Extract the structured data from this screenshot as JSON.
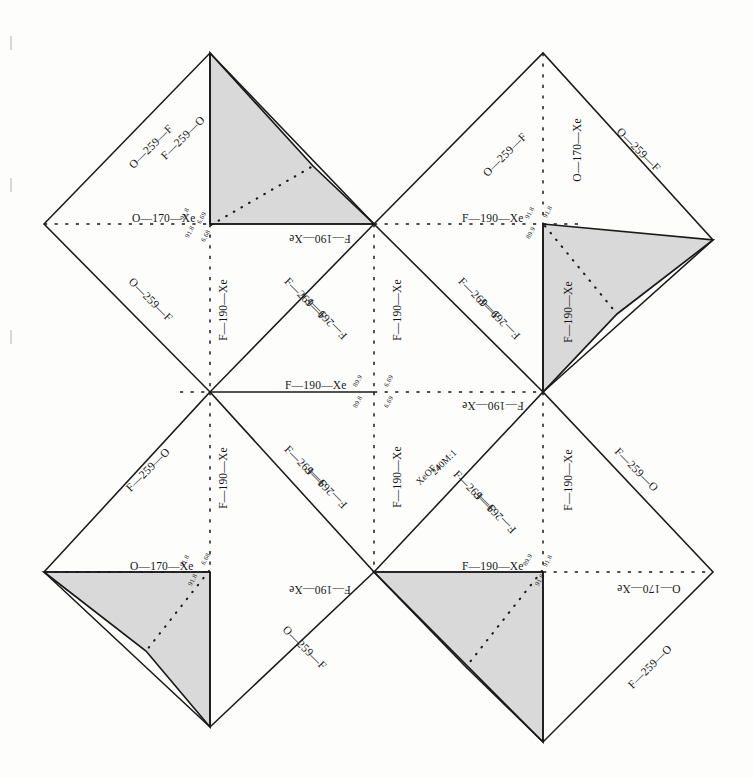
{
  "figure": {
    "type": "crystal-net",
    "scale_note": "240M:1",
    "formula": "XeOF",
    "formula_sub": "4",
    "shade_color": "#d9d9d9",
    "line_color": "#1a1a1a",
    "background": "#fdfdfc"
  },
  "bond_labels": {
    "o170xe": "O—170—Xe",
    "o259f": "O—259—F",
    "f259o": "F—259—O",
    "f190xe": "F—190—Xe",
    "f269f": "F—269—F"
  },
  "angles": {
    "a918": "91.8",
    "a899": "89.9",
    "a898": "89.8",
    "a669": "6.69",
    "a668": "6.68"
  },
  "labels": [
    {
      "id": "tl-edge-nw",
      "text": "O—259—F",
      "x": 123,
      "y": 147,
      "rot": -45,
      "cls": ""
    },
    {
      "id": "tl-edge-n",
      "text": "F—259—O",
      "x": 155,
      "y": 138,
      "rot": -45,
      "cls": ""
    },
    {
      "id": "tl-mid-h",
      "text": "O—170—Xe",
      "x": 132,
      "y": 219,
      "rot": 0,
      "cls": ""
    },
    {
      "id": "tl-mid-v",
      "text": "F—190—Xe",
      "x": 193,
      "y": 310,
      "rot": -90,
      "cls": ""
    },
    {
      "id": "tl-edge-sw",
      "text": "O—259—F",
      "x": 122,
      "y": 300,
      "rot": 45,
      "cls": ""
    },
    {
      "id": "tl-base",
      "text": "F—190—Xe",
      "x": 289,
      "y": 238,
      "rot": 180,
      "cls": ""
    },
    {
      "id": "tl-diag-a",
      "text": "F—269—F",
      "x": 278,
      "y": 299,
      "rot": 45,
      "cls": ""
    },
    {
      "id": "tl-diag-b",
      "text": "F—269—F",
      "x": 299,
      "y": 318,
      "rot": 225,
      "cls": ""
    },
    {
      "id": "tr-edge-nw",
      "text": "O—259—F",
      "x": 477,
      "y": 155,
      "rot": -45,
      "cls": ""
    },
    {
      "id": "tr-vert",
      "text": "O—170—Xe",
      "x": 546,
      "y": 150,
      "rot": -90,
      "cls": ""
    },
    {
      "id": "tr-edge-ne",
      "text": "O—259—F",
      "x": 610,
      "y": 150,
      "rot": 45,
      "cls": ""
    },
    {
      "id": "tr-mid-h",
      "text": "F—190—Xe",
      "x": 462,
      "y": 219,
      "rot": 0,
      "cls": ""
    },
    {
      "id": "tr-mid-v",
      "text": "F—190—Xe",
      "x": 538,
      "y": 312,
      "rot": -90,
      "cls": ""
    },
    {
      "id": "tr-diag-a",
      "text": "F—269—F",
      "x": 452,
      "y": 299,
      "rot": 45,
      "cls": ""
    },
    {
      "id": "tr-diag-b",
      "text": "F—269—F",
      "x": 472,
      "y": 318,
      "rot": 225,
      "cls": ""
    },
    {
      "id": "bl-mid-v",
      "text": "F—190—Xe",
      "x": 193,
      "y": 478,
      "rot": -90,
      "cls": ""
    },
    {
      "id": "bl-diag-a",
      "text": "F—269—F",
      "x": 278,
      "y": 467,
      "rot": 45,
      "cls": ""
    },
    {
      "id": "bl-diag-b",
      "text": "F—269—F",
      "x": 299,
      "y": 487,
      "rot": 225,
      "cls": ""
    },
    {
      "id": "bl-edge-nw",
      "text": "F—259—O",
      "x": 120,
      "y": 470,
      "rot": -45,
      "cls": ""
    },
    {
      "id": "bl-mid-h",
      "text": "O—170—Xe",
      "x": 130,
      "y": 567,
      "rot": 0,
      "cls": ""
    },
    {
      "id": "bl-base",
      "text": "F—190—Xe",
      "x": 289,
      "y": 589,
      "rot": 180,
      "cls": ""
    },
    {
      "id": "bl-edge-sw",
      "text": "O—259—F",
      "x": 276,
      "y": 648,
      "rot": 45,
      "cls": ""
    },
    {
      "id": "ctr-mid-h",
      "text": "F—190—Xe",
      "x": 285,
      "y": 386,
      "rot": 0,
      "cls": ""
    },
    {
      "id": "ctr-mid-v",
      "text": "F—190—Xe",
      "x": 367,
      "y": 310,
      "rot": -90,
      "cls": ""
    },
    {
      "id": "ctr-mid-v2",
      "text": "F—190—Xe",
      "x": 367,
      "y": 477,
      "rot": -90,
      "cls": ""
    },
    {
      "id": "ctr-right-h",
      "text": "F—190—Xe",
      "x": 462,
      "y": 405,
      "rot": 180,
      "cls": ""
    },
    {
      "id": "br-scale",
      "text": "240M:1",
      "x": 428,
      "y": 462,
      "rot": -45,
      "cls": "cap"
    },
    {
      "id": "br-diag-a",
      "text": "F—269—F",
      "x": 447,
      "y": 492,
      "rot": 45,
      "cls": ""
    },
    {
      "id": "br-diag-b",
      "text": "F—269—F",
      "x": 468,
      "y": 512,
      "rot": 225,
      "cls": ""
    },
    {
      "id": "br-mid-v",
      "text": "F—190—Xe",
      "x": 538,
      "y": 480,
      "rot": -90,
      "cls": ""
    },
    {
      "id": "br-edge-ne",
      "text": "F—259—O",
      "x": 608,
      "y": 470,
      "rot": 45,
      "cls": ""
    },
    {
      "id": "br-base",
      "text": "F—190—Xe",
      "x": 462,
      "y": 567,
      "rot": 0,
      "cls": ""
    },
    {
      "id": "br-mid-h",
      "text": "O—170—Xe",
      "x": 617,
      "y": 588,
      "rot": 180,
      "cls": ""
    },
    {
      "id": "br-edge-se",
      "text": "F—259—O",
      "x": 622,
      "y": 667,
      "rot": -45,
      "cls": ""
    }
  ],
  "angle_marks": [
    {
      "id": "tl-a1",
      "text": "91.8",
      "x": 185,
      "y": 214,
      "rot": -62
    },
    {
      "id": "tl-a2",
      "text": "91.8",
      "x": 190,
      "y": 232,
      "rot": -62
    },
    {
      "id": "tl-a3",
      "text": "6.68",
      "x": 206,
      "y": 236,
      "rot": -62
    },
    {
      "id": "tl-a4",
      "text": "6.69",
      "x": 202,
      "y": 218,
      "rot": -62
    },
    {
      "id": "tr-a1",
      "text": "91.8",
      "x": 530,
      "y": 213,
      "rot": -62
    },
    {
      "id": "tr-a2",
      "text": "91.8",
      "x": 548,
      "y": 212,
      "rot": -62
    },
    {
      "id": "tr-a3",
      "text": "89.9",
      "x": 531,
      "y": 233,
      "rot": -62
    },
    {
      "id": "c-a1",
      "text": "89.9",
      "x": 358,
      "y": 381,
      "rot": -62
    },
    {
      "id": "c-a2",
      "text": "6.69",
      "x": 389,
      "y": 381,
      "rot": -62
    },
    {
      "id": "c-a3",
      "text": "89.8",
      "x": 358,
      "y": 402,
      "rot": -62
    },
    {
      "id": "c-a4",
      "text": "6.69",
      "x": 389,
      "y": 402,
      "rot": -62
    },
    {
      "id": "bl-a1",
      "text": "91.8",
      "x": 185,
      "y": 561,
      "rot": -62
    },
    {
      "id": "bl-a2",
      "text": "6.68",
      "x": 206,
      "y": 559,
      "rot": -62
    },
    {
      "id": "bl-a3",
      "text": "91.8",
      "x": 193,
      "y": 580,
      "rot": -62
    },
    {
      "id": "br-a1",
      "text": "89.9",
      "x": 528,
      "y": 560,
      "rot": -62
    },
    {
      "id": "br-a2",
      "text": "91.8",
      "x": 548,
      "y": 561,
      "rot": -62
    },
    {
      "id": "br-a3",
      "text": "91.8",
      "x": 540,
      "y": 580,
      "rot": -62
    }
  ]
}
